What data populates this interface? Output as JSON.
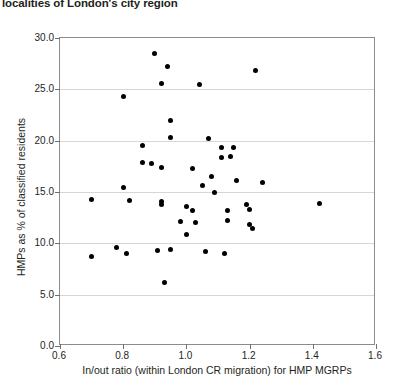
{
  "caption": "localities of London's city region",
  "chart_data": {
    "type": "scatter",
    "title": "localities of London's city region",
    "xlabel": "In/out ratio (within London CR migration) for HMP MGRPs",
    "ylabel": "HMPs as % of classified residents",
    "xlim": [
      0.6,
      1.6
    ],
    "ylim": [
      0.0,
      30.0
    ],
    "xticks": [
      "0.6",
      "0.8",
      "1.0",
      "1.2",
      "1.4",
      "1.6"
    ],
    "xtick_values": [
      0.6,
      0.8,
      1.0,
      1.2,
      1.4,
      1.6
    ],
    "yticks": [
      "0.0",
      "5.0",
      "10.0",
      "15.0",
      "20.0",
      "25.0",
      "30.0"
    ],
    "ytick_values": [
      0.0,
      5.0,
      10.0,
      15.0,
      20.0,
      25.0,
      30.0
    ],
    "grid": "horizontal",
    "legend": "none",
    "marker": "filled-diamond",
    "marker_color": "#000000",
    "points": [
      {
        "x": 0.9,
        "y": 28.5
      },
      {
        "x": 0.94,
        "y": 27.2
      },
      {
        "x": 0.92,
        "y": 25.6
      },
      {
        "x": 1.04,
        "y": 25.5
      },
      {
        "x": 1.22,
        "y": 26.8
      },
      {
        "x": 0.8,
        "y": 24.3
      },
      {
        "x": 0.95,
        "y": 22.0
      },
      {
        "x": 0.95,
        "y": 20.3
      },
      {
        "x": 0.86,
        "y": 19.5
      },
      {
        "x": 1.07,
        "y": 20.2
      },
      {
        "x": 1.11,
        "y": 19.3
      },
      {
        "x": 1.15,
        "y": 19.3
      },
      {
        "x": 0.86,
        "y": 17.9
      },
      {
        "x": 0.89,
        "y": 17.8
      },
      {
        "x": 0.92,
        "y": 17.4
      },
      {
        "x": 1.11,
        "y": 18.4
      },
      {
        "x": 1.14,
        "y": 18.5
      },
      {
        "x": 1.02,
        "y": 17.3
      },
      {
        "x": 1.08,
        "y": 16.5
      },
      {
        "x": 1.05,
        "y": 15.6
      },
      {
        "x": 1.09,
        "y": 15.0
      },
      {
        "x": 1.16,
        "y": 16.1
      },
      {
        "x": 1.24,
        "y": 15.9
      },
      {
        "x": 0.8,
        "y": 15.4
      },
      {
        "x": 0.82,
        "y": 14.2
      },
      {
        "x": 0.7,
        "y": 14.3
      },
      {
        "x": 0.92,
        "y": 14.1
      },
      {
        "x": 0.92,
        "y": 13.8
      },
      {
        "x": 1.0,
        "y": 13.6
      },
      {
        "x": 1.02,
        "y": 13.2
      },
      {
        "x": 0.98,
        "y": 12.1
      },
      {
        "x": 1.03,
        "y": 12.0
      },
      {
        "x": 1.13,
        "y": 13.2
      },
      {
        "x": 1.19,
        "y": 13.8
      },
      {
        "x": 1.2,
        "y": 13.3
      },
      {
        "x": 1.13,
        "y": 12.2
      },
      {
        "x": 1.2,
        "y": 11.8
      },
      {
        "x": 1.21,
        "y": 11.4
      },
      {
        "x": 1.0,
        "y": 10.9
      },
      {
        "x": 0.95,
        "y": 9.4
      },
      {
        "x": 0.7,
        "y": 8.7
      },
      {
        "x": 0.78,
        "y": 9.6
      },
      {
        "x": 0.81,
        "y": 9.0
      },
      {
        "x": 0.91,
        "y": 9.3
      },
      {
        "x": 1.06,
        "y": 9.2
      },
      {
        "x": 1.12,
        "y": 9.0
      },
      {
        "x": 0.93,
        "y": 6.2
      },
      {
        "x": 1.42,
        "y": 13.9
      }
    ]
  }
}
